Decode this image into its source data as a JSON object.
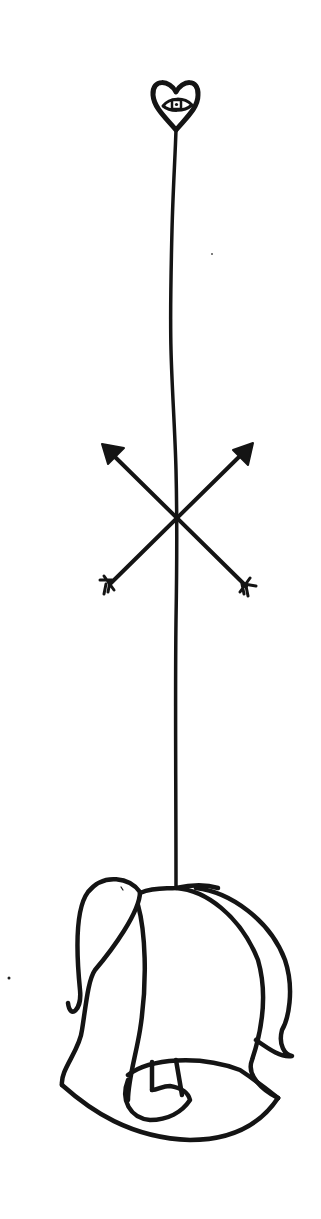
{
  "illustration": {
    "title": "Hand-drawn line illustration: heart with eye, crossed arrows, and a tied scroll/bundle hanging on a line",
    "style": "black ink line art on white",
    "colors": {
      "background": "#ffffff",
      "ink": "#141414"
    },
    "elements": [
      {
        "name": "heart-with-eye",
        "position": "top",
        "description": "Small heart outline containing an eye"
      },
      {
        "name": "stem-line",
        "position": "vertical center",
        "description": "Thin wavy vertical line connecting all elements"
      },
      {
        "name": "crossed-arrows",
        "position": "middle",
        "description": "Two arrows crossing in an X over the line, arrowheads up-left and up-right, fletching down-left and down-right"
      },
      {
        "name": "scroll-bundle",
        "position": "bottom",
        "description": "Draped cloth / rolled scroll shape hanging from the line"
      }
    ]
  }
}
